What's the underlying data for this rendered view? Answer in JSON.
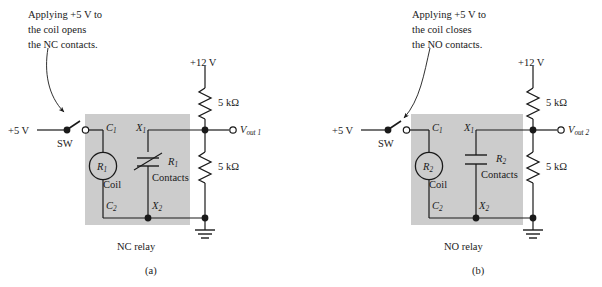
{
  "figure": {
    "panels": [
      {
        "id": "a",
        "caption": "(a)",
        "annotation": "Applying +5 V to\nthe coil opens\nthe NC contacts.",
        "supply_label": "+5 V",
        "switch_label": "SW",
        "rail_label": "+12 V",
        "resistor_top_label": "5 kΩ",
        "resistor_bottom_label": "5 kΩ",
        "coil_label": "R",
        "coil_sub": "1",
        "coil_name": "Coil",
        "terminal_c1": "C",
        "terminal_c1_sub": "1",
        "terminal_c2": "C",
        "terminal_c2_sub": "2",
        "terminal_x1": "X",
        "terminal_x1_sub": "1",
        "terminal_x2": "X",
        "terminal_x2_sub": "2",
        "contacts_label": "R",
        "contacts_sub": "1",
        "contacts_name": "Contacts",
        "relay_name": "NC relay",
        "output_label": "V",
        "output_sub": "out 1",
        "contact_type": "normally-closed"
      },
      {
        "id": "b",
        "caption": "(b)",
        "annotation": "Applying +5 V to\nthe coil closes\nthe NO contacts.",
        "supply_label": "+5 V",
        "switch_label": "SW",
        "rail_label": "+12 V",
        "resistor_top_label": "5 kΩ",
        "resistor_bottom_label": "5 kΩ",
        "coil_label": "R",
        "coil_sub": "2",
        "coil_name": "Coil",
        "terminal_c1": "C",
        "terminal_c1_sub": "1",
        "terminal_c2": "C",
        "terminal_c2_sub": "2",
        "terminal_x1": "X",
        "terminal_x1_sub": "1",
        "terminal_x2": "X",
        "terminal_x2_sub": "2",
        "contacts_label": "R",
        "contacts_sub": "2",
        "contacts_name": "Contacts",
        "relay_name": "NO relay",
        "output_label": "V",
        "output_sub": "out 2",
        "contact_type": "normally-open"
      }
    ],
    "colors": {
      "relay_box_fill": "#cccccc",
      "wire": "#1a1a1a",
      "background": "#ffffff"
    }
  }
}
